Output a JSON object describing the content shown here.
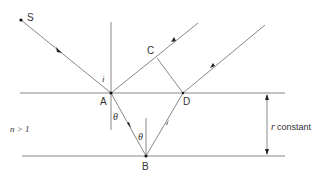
{
  "diagram": {
    "type": "thin-film reflection geometry",
    "labels": {
      "source": "S",
      "point_a": "A",
      "point_b": "B",
      "point_c": "C",
      "point_d": "D",
      "incidence_angle": "i",
      "refraction_angle_a": "θ",
      "refraction_angle_b": "θ",
      "medium": "n > 1",
      "thickness_symbol": "r",
      "thickness_note": "constant"
    },
    "colors": {
      "line": "#888888",
      "text": "#333333",
      "point": "#111111"
    }
  }
}
